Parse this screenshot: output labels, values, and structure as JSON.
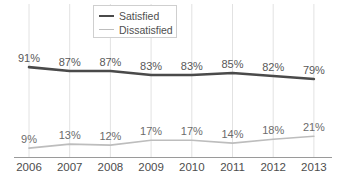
{
  "chart_data": {
    "type": "line",
    "title": "",
    "subtitle": "",
    "xlabel": "",
    "ylabel": "",
    "categories": [
      "2006",
      "2007",
      "2008",
      "2009",
      "2010",
      "2011",
      "2012",
      "2013"
    ],
    "ylim": [
      0,
      100
    ],
    "grid": "vertical-only",
    "legend_position": "top-center",
    "value_suffix": "%",
    "series": [
      {
        "name": "Satisfied",
        "color": "#4a4a4a",
        "values": [
          91,
          87,
          87,
          83,
          83,
          85,
          82,
          79
        ],
        "labels": [
          "91%",
          "87%",
          "87%",
          "83%",
          "83%",
          "85%",
          "82%",
          "79%"
        ]
      },
      {
        "name": "Dissatisfied",
        "color": "#bdbdbd",
        "values": [
          9,
          13,
          12,
          17,
          17,
          14,
          18,
          21
        ],
        "labels": [
          "9%",
          "13%",
          "12%",
          "17%",
          "17%",
          "14%",
          "18%",
          "21%"
        ]
      }
    ]
  },
  "legend": {
    "entries": [
      {
        "label": "Satisfied",
        "icon": "line-swatch-icon"
      },
      {
        "label": "Dissatisfied",
        "icon": "line-swatch-icon"
      }
    ]
  },
  "axis": {
    "x_tick_labels": [
      "2006",
      "2007",
      "2008",
      "2009",
      "2010",
      "2011",
      "2012",
      "2013"
    ]
  },
  "colors": {
    "satisfied_line": "#4a4a4a",
    "dissatisfied_line": "#bdbdbd",
    "gridline": "#e2e2e2",
    "axis_line": "#9a9a9a",
    "label_text": "#585858",
    "background": "#ffffff"
  }
}
